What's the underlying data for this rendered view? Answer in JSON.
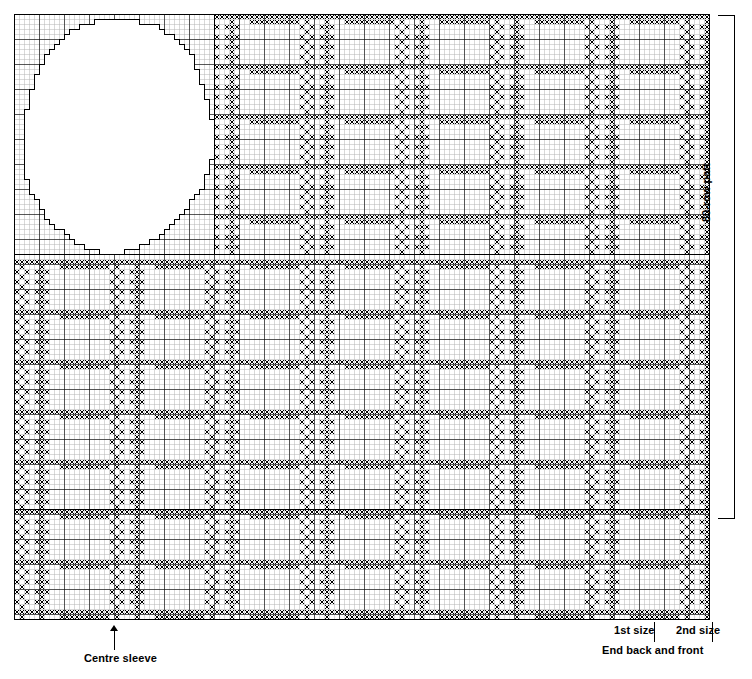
{
  "document": {
    "type": "knitting-pattern-chart",
    "title": "Fair Isle knitting chart",
    "width_px": 752,
    "height_px": 679
  },
  "annotations": {
    "centre_sleeve": "Centre sleeve",
    "first_size": "1st size",
    "second_size": "2nd size",
    "end_back_and_front": "End back and front",
    "row_repeat": "80-row patt"
  },
  "colors": {
    "ink": "#000000",
    "paper": "#ffffff",
    "grid_light": "#b4b4b4",
    "grid_heavy": "#000000"
  },
  "chart_data": {
    "type": "heatmap",
    "xlabel": "stitches",
    "ylabel": "rows",
    "grid": true,
    "legend": "none",
    "cell_px": 5,
    "columns": 139,
    "rows": 121,
    "symbol_filled": "cross-stitch",
    "symbol_empty": "blank",
    "bands": [
      {
        "name": "top-band",
        "rows": [
          0,
          48
        ],
        "note": "sleeve motif outline at left, patterned repeat to right"
      },
      {
        "name": "middle-band",
        "rows": [
          49,
          98
        ],
        "note": "full-width patterned repeat"
      },
      {
        "name": "bottom-band",
        "rows": [
          99,
          121
        ],
        "note": "full-width patterned repeat"
      }
    ],
    "motif": {
      "name": "sleeve-shaping-outline",
      "shape": "stepped-circle",
      "bounds_cells": {
        "x": 1,
        "y": 0,
        "w": 39,
        "h": 48
      }
    },
    "repeat": {
      "horizontal_cells": 19,
      "vertical_rows": 80
    },
    "markers": [
      {
        "label": "Centre sleeve",
        "x_px": 114,
        "edge": "bottom"
      },
      {
        "label": "1st size",
        "x_px": 654,
        "edge": "bottom"
      },
      {
        "label": "2nd size",
        "x_px": 712,
        "edge": "bottom"
      }
    ]
  }
}
